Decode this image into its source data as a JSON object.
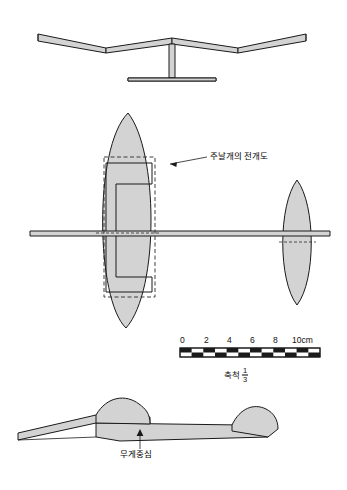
{
  "figure": {
    "title_hidden": "",
    "views": [
      {
        "name": "front-view",
        "description": "front elevation of glider wing with dihedral"
      },
      {
        "name": "plan-view",
        "description": "top plan view of wing and tailplane"
      },
      {
        "name": "side-view",
        "description": "side elevation of glider"
      }
    ]
  },
  "labels": {
    "wing_development": "주날개의 전개도",
    "center_of_gravity": "무게중심"
  },
  "scale_bar": {
    "ticks": [
      "0",
      "2",
      "4",
      "6",
      "8",
      "10cm"
    ],
    "tick_positions_px": [
      2,
      26,
      50,
      74,
      98,
      116
    ],
    "caption_prefix": "축척",
    "fraction_numerator": "1",
    "fraction_denominator": "3"
  },
  "colors": {
    "fill": "#d4d4d4",
    "fill_light": "#dcdcdc",
    "outline": "#1a1a1a",
    "dashed": "#333333",
    "background": "#ffffff"
  }
}
